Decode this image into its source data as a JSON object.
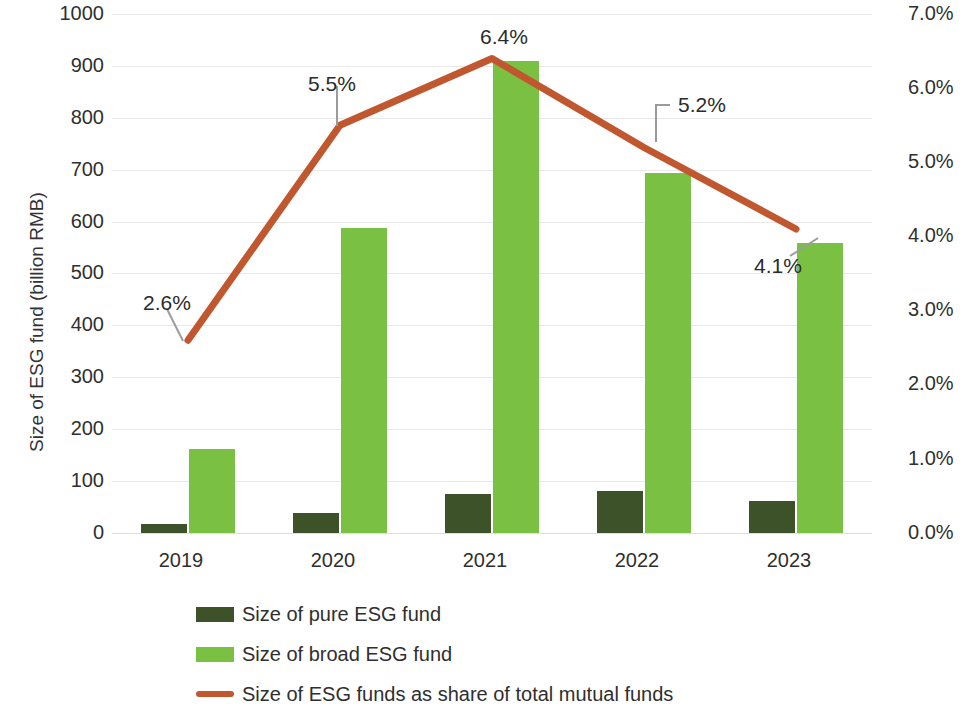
{
  "chart_data": {
    "type": "bar",
    "title": "",
    "xlabel": "",
    "ylabel": "Size of  ESG fund (billion RMB)",
    "y2label": "",
    "categories": [
      "2019",
      "2020",
      "2021",
      "2022",
      "2023"
    ],
    "ylim": [
      0,
      1000
    ],
    "y_ticks": [
      "0",
      "100",
      "200",
      "300",
      "400",
      "500",
      "600",
      "700",
      "800",
      "900",
      "1000"
    ],
    "y2lim": [
      0,
      7
    ],
    "y2_ticks": [
      "0.0%",
      "1.0%",
      "2.0%",
      "3.0%",
      "4.0%",
      "5.0%",
      "6.0%",
      "7.0%"
    ],
    "grid": true,
    "legend_position": "bottom-left",
    "series": [
      {
        "name": "Size of pure ESG fund",
        "type": "bar",
        "axis": "left",
        "color": "#3d5229",
        "values": [
          18,
          38,
          75,
          80,
          62
        ]
      },
      {
        "name": "Size of broad ESG fund",
        "type": "bar",
        "axis": "left",
        "color": "#7ac143",
        "values": [
          162,
          588,
          910,
          693,
          558
        ]
      },
      {
        "name": "Size of ESG funds as share of total mutual funds",
        "type": "line",
        "axis": "right",
        "color": "#c0572f",
        "values": [
          2.6,
          5.5,
          6.4,
          5.2,
          4.1
        ],
        "data_labels": [
          "2.6%",
          "5.5%",
          "6.4%",
          "5.2%",
          "4.1%"
        ]
      }
    ]
  },
  "legend": {
    "items": [
      {
        "label": "Size of pure ESG fund",
        "marker": "square",
        "color": "#3d5229"
      },
      {
        "label": "Size of broad ESG fund",
        "marker": "square",
        "color": "#7ac143"
      },
      {
        "label": "Size of ESG funds as share of total mutual funds",
        "marker": "line",
        "color": "#c0572f"
      }
    ]
  }
}
